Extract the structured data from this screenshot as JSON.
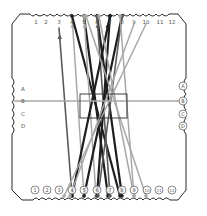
{
  "diagram": {
    "type": "braiding-card",
    "colors": {
      "outline": "#2a2a2a",
      "thread_dark": "#1e1e1e",
      "thread_mid": "#5a5a5a",
      "thread_light": "#a8a8a8",
      "label": "#555555",
      "background": "#ffffff"
    },
    "top_slots": [
      {
        "label": "1",
        "x": 36
      },
      {
        "label": "2",
        "x": 46
      },
      {
        "label": "3",
        "x": 59
      },
      {
        "label": "4",
        "x": 72
      },
      {
        "label": "5",
        "x": 84
      },
      {
        "label": "6",
        "x": 97
      },
      {
        "label": "7",
        "x": 110
      },
      {
        "label": "8",
        "x": 122
      },
      {
        "label": "9",
        "x": 134
      },
      {
        "label": "10",
        "x": 146
      },
      {
        "label": "11",
        "x": 160
      },
      {
        "label": "12",
        "x": 172
      }
    ],
    "bottom_slots": [
      {
        "label": "1",
        "x": 35
      },
      {
        "label": "2",
        "x": 47
      },
      {
        "label": "3",
        "x": 59
      },
      {
        "label": "4",
        "x": 72
      },
      {
        "label": "5",
        "x": 84
      },
      {
        "label": "6",
        "x": 97
      },
      {
        "label": "7",
        "x": 110
      },
      {
        "label": "8",
        "x": 122
      },
      {
        "label": "9",
        "x": 134
      },
      {
        "label": "10",
        "x": 147
      },
      {
        "label": "11",
        "x": 159
      },
      {
        "label": "12",
        "x": 172
      }
    ],
    "left_slots": [
      {
        "label": "A",
        "y": 89
      },
      {
        "label": "B",
        "y": 101
      },
      {
        "label": "C",
        "y": 114
      },
      {
        "label": "D",
        "y": 126
      }
    ],
    "right_slots": [
      {
        "label": "A",
        "y": 86
      },
      {
        "label": "B",
        "y": 101
      },
      {
        "label": "C",
        "y": 114
      },
      {
        "label": "D",
        "y": 126
      }
    ],
    "center_box": {
      "x": 80,
      "y": 94,
      "w": 47,
      "h": 24
    },
    "threads": [
      {
        "from": "top-3",
        "to": "bottom-4",
        "x1": 59,
        "y1": 28,
        "x2": 72,
        "y2": 196,
        "tone": "mid",
        "arrow": true
      },
      {
        "from": "top-4",
        "to": "bottom-5",
        "x1": 72,
        "y1": 16,
        "x2": 84,
        "y2": 196,
        "tone": "light",
        "arrow": true
      },
      {
        "from": "top-4",
        "to": "bottom-8",
        "x1": 72,
        "y1": 16,
        "x2": 120,
        "y2": 196,
        "tone": "dark"
      },
      {
        "from": "top-5",
        "to": "bottom-7",
        "x1": 84,
        "y1": 16,
        "x2": 108,
        "y2": 196,
        "tone": "dark"
      },
      {
        "from": "top-5",
        "to": "bottom-6",
        "x1": 84,
        "y1": 16,
        "x2": 96,
        "y2": 196,
        "tone": "light",
        "arrow": true
      },
      {
        "from": "top-6",
        "to": "bottom-8",
        "x1": 97,
        "y1": 16,
        "x2": 122,
        "y2": 196,
        "tone": "dark"
      },
      {
        "from": "top-6",
        "to": "bottom-7",
        "x1": 97,
        "y1": 16,
        "x2": 110,
        "y2": 196,
        "tone": "mid",
        "arrow": true
      },
      {
        "from": "top-7",
        "to": "bottom-4",
        "x1": 110,
        "y1": 16,
        "x2": 72,
        "y2": 196,
        "tone": "dark",
        "arrow": true
      },
      {
        "from": "top-7",
        "to": "bottom-6",
        "x1": 110,
        "y1": 16,
        "x2": 97,
        "y2": 196,
        "tone": "dark"
      },
      {
        "from": "top-8",
        "to": "bottom-5",
        "x1": 122,
        "y1": 16,
        "x2": 84,
        "y2": 196,
        "tone": "dark"
      },
      {
        "from": "top-8",
        "to": "bottom-6",
        "x1": 122,
        "y1": 16,
        "x2": 98,
        "y2": 196,
        "tone": "mid"
      },
      {
        "from": "top-8",
        "to": "bottom-9",
        "x1": 120,
        "y1": 16,
        "x2": 134,
        "y2": 196,
        "tone": "light"
      },
      {
        "from": "top-9",
        "to": "bottom-4",
        "x1": 134,
        "y1": 24,
        "x2": 70,
        "y2": 196,
        "tone": "light"
      },
      {
        "from": "top-10",
        "to": "bottom-3",
        "x1": 146,
        "y1": 24,
        "x2": 64,
        "y2": 196,
        "tone": "light"
      },
      {
        "from": "top-5",
        "to": "bottom-10",
        "x1": 86,
        "y1": 16,
        "x2": 146,
        "y2": 196,
        "tone": "light"
      },
      {
        "from": "top-6",
        "to": "bottom-9",
        "x1": 99,
        "y1": 16,
        "x2": 134,
        "y2": 196,
        "tone": "light"
      },
      {
        "from": "left-B",
        "to": "right-B",
        "x1": 13,
        "y1": 101,
        "x2": 183,
        "y2": 101,
        "tone": "light",
        "horizontal": true
      }
    ]
  }
}
